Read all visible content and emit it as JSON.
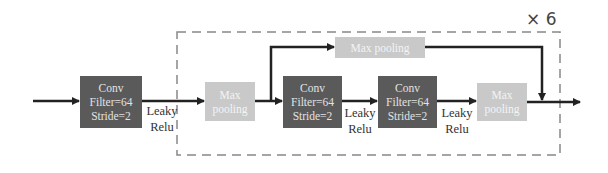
{
  "diagram": {
    "repeat_label": "× 6",
    "input_block": {
      "conv": {
        "line1": "Conv",
        "line2": "Filter=64",
        "line3": "Stride=2"
      },
      "activation": {
        "line1": "Leaky",
        "line2": "Relu"
      }
    },
    "repeated_block": {
      "entry_pool": {
        "line1": "Max",
        "line2": "pooling"
      },
      "skip_pool": {
        "label": "Max pooling"
      },
      "conv_a": {
        "line1": "Conv",
        "line2": "Filter=64",
        "line3": "Stride=2"
      },
      "activation_a": {
        "line1": "Leaky",
        "line2": "Relu"
      },
      "conv_b": {
        "line1": "Conv",
        "line2": "Filter=64",
        "line3": "Stride=2"
      },
      "activation_b": {
        "line1": "Leaky",
        "line2": "Relu"
      },
      "exit_pool": {
        "line1": "Max",
        "line2": "pooling"
      }
    },
    "colors": {
      "conv_fill": "#5a5a5a",
      "pool_fill": "#c9c9c9",
      "arrow": "#222222",
      "dashed_border": "#888888"
    }
  }
}
